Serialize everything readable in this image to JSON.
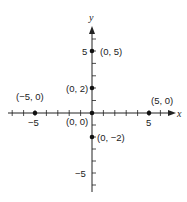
{
  "diagram": {
    "type": "cartesian-plane",
    "axes": {
      "x_label": "x",
      "y_label": "y"
    },
    "tick_labels": {
      "x_neg5": "−5",
      "x_pos5": "5",
      "y_pos5": "5",
      "y_neg5": "−5"
    },
    "points": [
      {
        "label": "(0, 5)",
        "x": 0,
        "y": 5
      },
      {
        "label": "(0, 2)",
        "x": 0,
        "y": 2
      },
      {
        "label": "(−5, 0)",
        "x": -5,
        "y": 0
      },
      {
        "label": "(5, 0)",
        "x": 5,
        "y": 0
      },
      {
        "label": "(0, 0)",
        "x": 0,
        "y": 0
      },
      {
        "label": "(0, −2)",
        "x": 0,
        "y": -2
      }
    ]
  }
}
